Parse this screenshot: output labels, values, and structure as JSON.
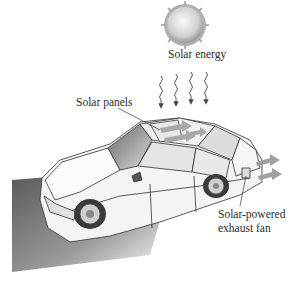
{
  "figure": {
    "labels": {
      "solar_energy": "Solar energy",
      "solar_panels": "Solar panels",
      "fan_line1": "Solar-powered",
      "fan_line2": "exhaust fan"
    },
    "colors": {
      "background": "#ffffff",
      "sun_fill": "#d9d9d9",
      "shadow": "#6e6e6e",
      "car_body": "#f2f2f2",
      "outline": "#333333",
      "arrow": "#9a9a9a"
    }
  }
}
